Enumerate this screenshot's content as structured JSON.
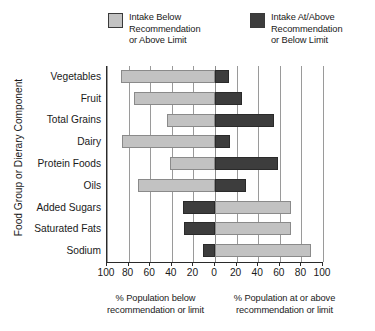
{
  "legend": {
    "entries": [
      {
        "swatch": "light-gray-swatch",
        "label": "Intake Below\nRecommendation\nor Above Limit",
        "color": "#c2c2c2"
      },
      {
        "swatch": "dark-gray-swatch",
        "label": "Intake At/Above\nRecommendation\nor Below Limit",
        "color": "#3d3d3d"
      }
    ]
  },
  "axes": {
    "ylabel": "Food Group or Dierary Component",
    "xticklabels": [
      "100",
      "80",
      "60",
      "40",
      "20",
      "0",
      "20",
      "40",
      "60",
      "80",
      "100"
    ],
    "xcaption_left": "% Population below\nrecommendation or limit",
    "xcaption_right": "% Population at or above\nrecommendation or limit"
  },
  "chart_data": {
    "type": "bar",
    "orientation": "horizontal",
    "layout": "diverging-bidirectional",
    "title": "",
    "xlabel": "% Population below recommendation or limit / % Population at or above recommendation or limit",
    "ylabel": "Food Group or Dierary Component",
    "categories": [
      "Vegetables",
      "Fruit",
      "Total Grains",
      "Dairy",
      "Protein Foods",
      "Oils",
      "Added Sugars",
      "Saturated Fats",
      "Sodium"
    ],
    "series": [
      {
        "name": "Intake Below Recommendation or Above Limit",
        "color": "#c2c2c2",
        "side": [
          "left",
          "left",
          "left",
          "left",
          "left",
          "left",
          "right",
          "right",
          "right"
        ],
        "values": [
          87,
          75,
          44,
          86,
          42,
          71,
          70,
          70,
          89
        ]
      },
      {
        "name": "Intake At/Above Recommendation or Below Limit",
        "color": "#3d3d3d",
        "side": [
          "right",
          "right",
          "right",
          "right",
          "right",
          "right",
          "left",
          "left",
          "left"
        ],
        "values": [
          13,
          25,
          55,
          14,
          58,
          29,
          30,
          29,
          11
        ]
      }
    ],
    "xlim": [
      -100,
      100
    ],
    "xticks": [
      -100,
      -80,
      -60,
      -40,
      -20,
      0,
      20,
      40,
      60,
      80,
      100
    ],
    "grid": true,
    "legend_position": "top"
  }
}
